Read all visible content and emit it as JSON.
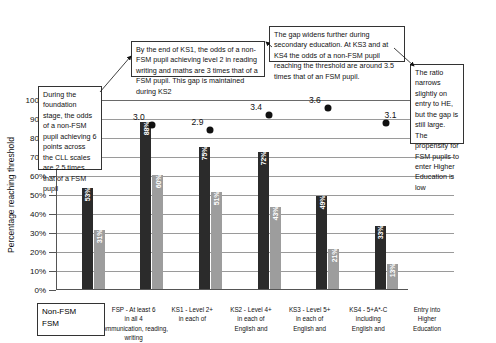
{
  "chart_data": {
    "type": "bar",
    "title": "",
    "xlabel": "",
    "ylabel": "Percentage reaching threshold",
    "ylim": [
      0,
      100
    ],
    "ytick_labels": [
      "0%",
      "10%",
      "20%",
      "30%",
      "40%",
      "50%",
      "60%",
      "70%",
      "80%",
      "90%",
      "100%"
    ],
    "ytick_values": [
      0,
      10,
      20,
      30,
      40,
      50,
      60,
      70,
      80,
      90,
      100
    ],
    "grid": true,
    "legend_position": "bottom-left",
    "categories": [
      "FSP - At least 6 in all 4 communication, reading, writing",
      "KS1 - Level 2+ in each of communication, reading, writing",
      "KS2 - Level 4+ in each of English and",
      "KS3 - Level 5+ in each of English and",
      "KS4 - 5+A*-C including English and",
      "Entry into Higher Education"
    ],
    "category_lines": [
      [
        "FSP - At least 6",
        "in all 4",
        "communication, reading, writing"
      ],
      [
        "KS1 - Level 2+",
        "in each of",
        ""
      ],
      [
        "KS2 - Level 4+",
        "in each of",
        "English and"
      ],
      [
        "KS3 - Level 5+",
        "in each of",
        "English and"
      ],
      [
        "KS4 - 5+A*-C",
        "including",
        "English and"
      ],
      [
        "Entry into",
        "Higher",
        "Education"
      ]
    ],
    "series": [
      {
        "name": "Non-FSM",
        "color": "#2b2b2b",
        "values": [
          53,
          88,
          75,
          72,
          49,
          33
        ],
        "value_labels": [
          "53%",
          "88%",
          "75%",
          "72%",
          "49%",
          "33%"
        ]
      },
      {
        "name": "FSM",
        "color": "#9d9d9d",
        "values": [
          31,
          60,
          51,
          43,
          21,
          13
        ],
        "value_labels": [
          "31%",
          "60%",
          "51%",
          "43%",
          "21%",
          "13%"
        ]
      }
    ],
    "ratio_markers": {
      "name": "Odds ratio (Non-FSM vs FSM)",
      "labels": [
        "2.5",
        "3.0",
        "2.9",
        "3.4",
        "3.6",
        "3.1"
      ],
      "values": [
        2.5,
        3.0,
        2.9,
        3.4,
        3.6,
        3.1
      ],
      "plotted_percent": [
        79,
        87,
        84,
        92,
        96,
        88
      ]
    }
  },
  "legend": {
    "items": [
      "Non-FSM",
      "FSM"
    ]
  },
  "annotations": [
    {
      "id": "foundation-stage",
      "text": "During the foundation stage, the odds of a non-FSM pupil achieving 6 points across the CLL scales are 2.5 times that of a FSM pupil"
    },
    {
      "id": "end-of-ks1",
      "text": "By the end of KS1, the odds of a non-FSM pupil achieving level 2 in reading writing and maths are 3 times that of a FSM pupil. This gap is maintained during KS2"
    },
    {
      "id": "secondary-gap",
      "text": "The gap widens further during secondary education. At KS3 and at KS4 the odds of a non-FSM pupil reaching the threshold are around 3.5 times that of an FSM pupil."
    },
    {
      "id": "higher-education",
      "text": "The ratio narrows slightly on entry to HE, but the gap is still large. The propensity for FSM pupils to enter Higher Education is low"
    }
  ]
}
